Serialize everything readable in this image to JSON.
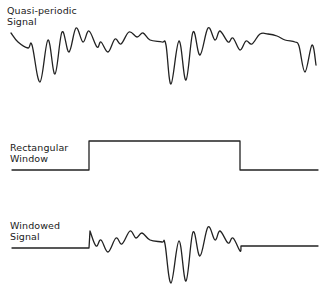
{
  "panels": [
    {
      "id": "quasi-periodic-signal",
      "label_lines": [
        "Quasi-periodic",
        "Signal"
      ],
      "waveform_points": [
        [
          11,
          33
        ],
        [
          18,
          42
        ],
        [
          28,
          48
        ],
        [
          32,
          45
        ],
        [
          40,
          82
        ],
        [
          48,
          40
        ],
        [
          55,
          74
        ],
        [
          62,
          32
        ],
        [
          69,
          52
        ],
        [
          76,
          28
        ],
        [
          83,
          42
        ],
        [
          89,
          31
        ],
        [
          97,
          47
        ],
        [
          101,
          42
        ],
        [
          108,
          52
        ],
        [
          115,
          39
        ],
        [
          121,
          44
        ],
        [
          129,
          32
        ],
        [
          137,
          37
        ],
        [
          143,
          33
        ],
        [
          150,
          40
        ],
        [
          162,
          42
        ],
        [
          166,
          45
        ],
        [
          171,
          84
        ],
        [
          179,
          41
        ],
        [
          186,
          80
        ],
        [
          193,
          32
        ],
        [
          200,
          55
        ],
        [
          208,
          28
        ],
        [
          215,
          40
        ],
        [
          220,
          31
        ],
        [
          228,
          42
        ],
        [
          233,
          38
        ],
        [
          240,
          50
        ],
        [
          246,
          41
        ],
        [
          252,
          44
        ],
        [
          260,
          34
        ],
        [
          268,
          34
        ],
        [
          277,
          36
        ],
        [
          285,
          40
        ],
        [
          295,
          42
        ],
        [
          299,
          46
        ],
        [
          305,
          72
        ],
        [
          312,
          45
        ],
        [
          316,
          65
        ]
      ]
    },
    {
      "id": "rectangular-window",
      "label_lines": [
        "Rectangular",
        "Window"
      ],
      "waveform_points": [
        [
          12,
          170
        ],
        [
          89,
          170
        ],
        [
          89,
          141
        ],
        [
          240,
          141
        ],
        [
          240,
          170
        ],
        [
          318,
          170
        ]
      ]
    },
    {
      "id": "windowed-signal",
      "label_lines": [
        "Windowed",
        "Signal"
      ],
      "waveform_points": [
        [
          12,
          248
        ],
        [
          89,
          248
        ],
        [
          90,
          231
        ],
        [
          96,
          246
        ],
        [
          101,
          240
        ],
        [
          108,
          252
        ],
        [
          116,
          238
        ],
        [
          122,
          244
        ],
        [
          130,
          231
        ],
        [
          136,
          238
        ],
        [
          142,
          233
        ],
        [
          150,
          240
        ],
        [
          162,
          242
        ],
        [
          165,
          244
        ],
        [
          171,
          283
        ],
        [
          179,
          241
        ],
        [
          186,
          281
        ],
        [
          193,
          232
        ],
        [
          200,
          256
        ],
        [
          208,
          227
        ],
        [
          215,
          240
        ],
        [
          220,
          231
        ],
        [
          228,
          243
        ],
        [
          233,
          238
        ],
        [
          240,
          251
        ],
        [
          241,
          246
        ],
        [
          318,
          246
        ]
      ]
    }
  ],
  "colors": {
    "line": "#222222",
    "text": "#1a1a1a",
    "background": "#ffffff"
  }
}
